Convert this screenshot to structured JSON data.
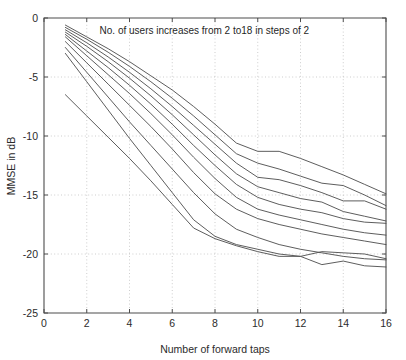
{
  "chart_data": {
    "type": "line",
    "title": "",
    "xlabel": "Number of forward taps",
    "ylabel": "MMSE in dB",
    "xlim": [
      0,
      16
    ],
    "ylim": [
      -25,
      0
    ],
    "xticks": [
      0,
      2,
      4,
      6,
      8,
      10,
      12,
      14,
      16
    ],
    "xtick_labels": [
      "0",
      "2",
      "4",
      "6",
      "8",
      "10",
      "12",
      "14",
      "16"
    ],
    "yticks": [
      0,
      -5,
      -10,
      -15,
      -20,
      -25
    ],
    "ytick_labels": [
      "0",
      "-5",
      "-10",
      "-15",
      "-20",
      "-25"
    ],
    "grid": true,
    "grid_style": "dotted",
    "legend": false,
    "legend_position": "none",
    "line_color": "#545454",
    "annotations": [
      {
        "text": "No. of users increases from 2 to18 in steps of 2",
        "x": 2.6,
        "y": -1.35
      }
    ],
    "x": [
      1,
      2,
      3,
      4,
      5,
      6,
      7,
      8,
      9,
      10,
      11,
      12,
      13,
      14,
      15,
      16
    ],
    "series": [
      {
        "name": "2 users",
        "values": [
          -0.6,
          -1.6,
          -2.6,
          -3.7,
          -4.9,
          -6.1,
          -7.5,
          -9.0,
          -10.6,
          -11.3,
          -11.3,
          -11.9,
          -12.6,
          -13.3,
          -14.1,
          -14.9
        ]
      },
      {
        "name": "4 users",
        "values": [
          -0.8,
          -1.8,
          -2.9,
          -4.1,
          -5.4,
          -6.8,
          -8.3,
          -9.9,
          -11.5,
          -12.3,
          -12.8,
          -13.4,
          -14.0,
          -14.2,
          -15.0,
          -15.9
        ]
      },
      {
        "name": "6 users",
        "values": [
          -1.0,
          -2.1,
          -3.3,
          -4.6,
          -6.0,
          -7.5,
          -9.1,
          -10.7,
          -12.3,
          -13.5,
          -13.7,
          -14.2,
          -14.8,
          -15.5,
          -15.5,
          -16.2
        ]
      },
      {
        "name": "8 users",
        "values": [
          -1.2,
          -2.4,
          -3.7,
          -5.1,
          -6.6,
          -8.2,
          -9.9,
          -11.6,
          -13.2,
          -14.3,
          -14.8,
          -15.3,
          -15.6,
          -16.4,
          -16.8,
          -17.2
        ]
      },
      {
        "name": "10 users",
        "values": [
          -1.4,
          -2.8,
          -4.2,
          -5.7,
          -7.3,
          -9.0,
          -10.8,
          -12.5,
          -14.1,
          -15.2,
          -15.8,
          -16.2,
          -16.5,
          -17.0,
          -17.3,
          -17.4
        ]
      },
      {
        "name": "12 users",
        "values": [
          -1.6,
          -3.2,
          -4.8,
          -6.4,
          -8.1,
          -9.9,
          -11.8,
          -13.6,
          -15.2,
          -16.2,
          -16.7,
          -17.1,
          -17.5,
          -17.9,
          -18.2,
          -18.4
        ]
      },
      {
        "name": "14 users",
        "values": [
          -2.0,
          -3.8,
          -5.6,
          -7.4,
          -9.2,
          -11.1,
          -13.1,
          -14.9,
          -16.2,
          -17.0,
          -17.5,
          -17.9,
          -18.3,
          -18.6,
          -18.9,
          -19.2
        ]
      },
      {
        "name": "16 users",
        "values": [
          -2.5,
          -4.6,
          -6.7,
          -8.8,
          -10.8,
          -12.8,
          -14.8,
          -16.6,
          -17.9,
          -18.6,
          -19.2,
          -19.6,
          -19.9,
          -20.2,
          -20.4,
          -20.5
        ]
      },
      {
        "name": "18 users",
        "values": [
          -3.0,
          -5.4,
          -7.8,
          -10.2,
          -12.5,
          -14.8,
          -17.1,
          -18.5,
          -19.2,
          -19.6,
          -20.0,
          -20.2,
          -20.9,
          -20.6,
          -21.0,
          -21.1
        ]
      },
      {
        "name": "18 users lower",
        "values": [
          -6.5,
          -8.3,
          -10.1,
          -11.9,
          -13.8,
          -15.8,
          -17.8,
          -18.7,
          -19.3,
          -19.8,
          -20.2,
          -20.2,
          -19.8,
          -19.9,
          -20.0,
          -20.4
        ]
      }
    ]
  },
  "figure": {
    "background_color": "#ffffff"
  }
}
